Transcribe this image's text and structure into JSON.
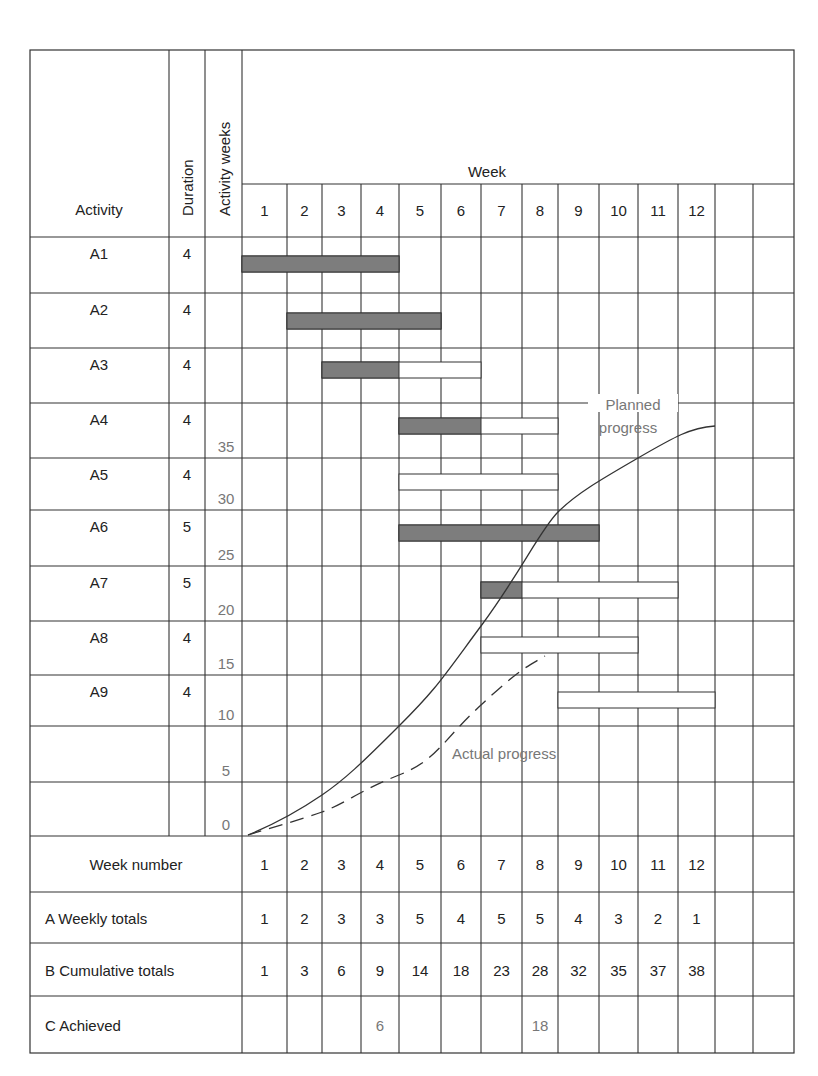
{
  "chart_data": {
    "type": "table",
    "title": "",
    "header": {
      "activity_label": "Activity",
      "duration_label": "Duration",
      "activity_weeks_label": "Activity weeks",
      "week_label": "Week"
    },
    "weeks": [
      1,
      2,
      3,
      4,
      5,
      6,
      7,
      8,
      9,
      10,
      11,
      12
    ],
    "activities": [
      {
        "name": "A1",
        "duration": 4,
        "start": 1,
        "end": 4,
        "solid_until": 4
      },
      {
        "name": "A2",
        "duration": 4,
        "start": 2,
        "end": 5,
        "solid_until": 5
      },
      {
        "name": "A3",
        "duration": 4,
        "start": 3,
        "end": 6,
        "solid_until": 4
      },
      {
        "name": "A4",
        "duration": 4,
        "start": 5,
        "end": 8,
        "solid_until": 6
      },
      {
        "name": "A5",
        "duration": 4,
        "start": 5,
        "end": 8,
        "solid_until": 0
      },
      {
        "name": "A6",
        "duration": 5,
        "start": 5,
        "end": 9,
        "solid_until": 9
      },
      {
        "name": "A7",
        "duration": 5,
        "start": 7,
        "end": 11,
        "solid_until": 7
      },
      {
        "name": "A8",
        "duration": 4,
        "start": 7,
        "end": 10,
        "solid_until": 0
      },
      {
        "name": "A9",
        "duration": 4,
        "start": 9,
        "end": 12,
        "solid_until": 0
      }
    ],
    "y_axis": {
      "label": "Activity weeks",
      "ticks": [
        35,
        30,
        25,
        20,
        15,
        10,
        5,
        0
      ],
      "ylim": [
        0,
        38
      ]
    },
    "series": [
      {
        "name": "Planned progress",
        "style": "solid",
        "x": [
          0,
          1,
          2,
          3,
          4,
          5,
          6,
          7,
          8,
          9,
          10,
          11,
          12
        ],
        "values": [
          0,
          1,
          3,
          6,
          9,
          14,
          18,
          23,
          28,
          32,
          35,
          37,
          38
        ]
      },
      {
        "name": "Actual progress",
        "style": "dashed",
        "x": [
          0,
          4,
          8
        ],
        "values": [
          0,
          6,
          18
        ]
      }
    ],
    "annotations": [
      "Planned progress",
      "Actual progress"
    ],
    "summary_rows": [
      {
        "label": "Week number",
        "values": [
          "1",
          "2",
          "3",
          "4",
          "5",
          "6",
          "7",
          "8",
          "9",
          "10",
          "11",
          "12"
        ]
      },
      {
        "label": "A Weekly totals",
        "values": [
          "1",
          "2",
          "3",
          "3",
          "5",
          "4",
          "5",
          "5",
          "4",
          "3",
          "2",
          "1"
        ]
      },
      {
        "label": "B Cumulative totals",
        "values": [
          "1",
          "3",
          "6",
          "9",
          "14",
          "18",
          "23",
          "28",
          "32",
          "35",
          "37",
          "38"
        ]
      },
      {
        "label": "C Achieved",
        "values": [
          "",
          "",
          "",
          "6",
          "",
          "",
          "",
          "18",
          "",
          "",
          "",
          ""
        ]
      }
    ]
  },
  "colors": {
    "line": "#333333",
    "bar_fill": "#7d7d7d",
    "label_gray": "#777777"
  }
}
